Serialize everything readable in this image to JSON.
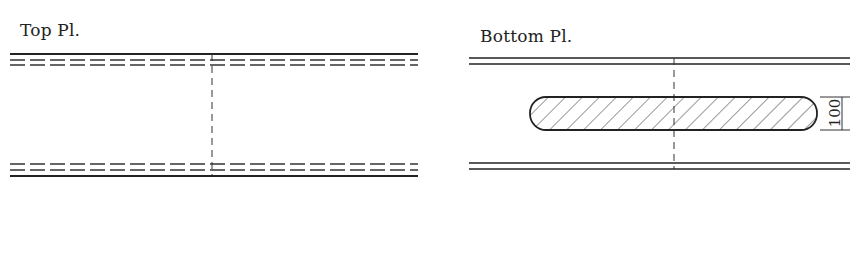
{
  "header": {
    "partial_title": ""
  },
  "top_plate": {
    "label": "Top Pl.",
    "lines": [
      "solid",
      "dashed",
      "dashed",
      "dashed",
      "dashed",
      "solid"
    ],
    "centerline": "dashed-vertical"
  },
  "bottom_plate": {
    "label": "Bottom Pl.",
    "lines": [
      "double-solid-top",
      "double-solid-bottom"
    ],
    "centerline": "dashed-vertical",
    "slot": {
      "shape": "rounded-slot",
      "fill": "hatched"
    },
    "dimension": {
      "value": "100"
    }
  },
  "colors": {
    "line": "#222222",
    "background": "#ffffff"
  }
}
